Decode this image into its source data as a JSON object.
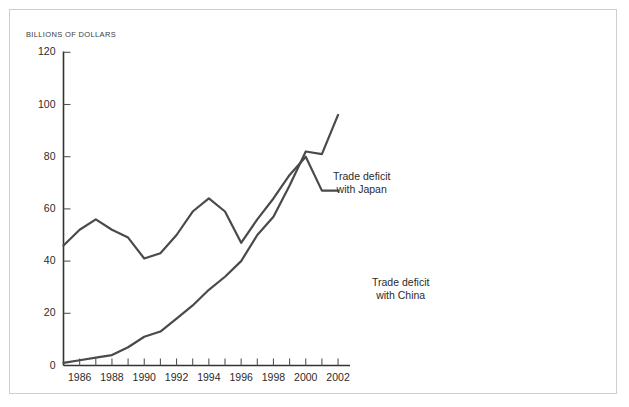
{
  "chart_data": {
    "type": "line",
    "title": "",
    "subtitle": "",
    "xlabel": "",
    "ylabel": "BILLIONS OF DOLLARS",
    "ylim": [
      0,
      128
    ],
    "xlim": [
      1985,
      2002
    ],
    "grid": false,
    "legend_position": "inline-annotations",
    "y_ticks": [
      0,
      20,
      40,
      60,
      80,
      100,
      120
    ],
    "y_tick_labels": [
      "0",
      "20",
      "40",
      "60",
      "80",
      "100",
      "120"
    ],
    "x_ticks": [
      1985,
      1986,
      1987,
      1988,
      1989,
      1990,
      1991,
      1992,
      1993,
      1994,
      1995,
      1996,
      1997,
      1998,
      1999,
      2000,
      2001,
      2002
    ],
    "x_tick_labels": [
      "",
      "1986",
      "",
      "1988",
      "",
      "1990",
      "",
      "1992",
      "",
      "1994",
      "",
      "1996",
      "",
      "1998",
      "",
      "2000",
      "",
      "2002"
    ],
    "x": [
      1985,
      1986,
      1987,
      1988,
      1989,
      1990,
      1991,
      1992,
      1993,
      1994,
      1995,
      1996,
      1997,
      1998,
      1999,
      2000,
      2001,
      2002
    ],
    "series": [
      {
        "name": "Trade deficit with Japan",
        "color": "#4a4a4a",
        "values": [
          46,
          52,
          56,
          52,
          49,
          41,
          43,
          50,
          59,
          64,
          59,
          47,
          56,
          64,
          73,
          80,
          67,
          67
        ]
      },
      {
        "name": "Trade deficit with China",
        "color": "#4a4a4a",
        "values": [
          1,
          2,
          3,
          4,
          7,
          11,
          13,
          18,
          23,
          29,
          34,
          40,
          50,
          57,
          69,
          82,
          81,
          96
        ]
      }
    ],
    "annotations": [
      {
        "name": "japan-annotation",
        "line1": "Trade deficit",
        "line2": "with Japan"
      },
      {
        "name": "china-annotation",
        "line1": "Trade deficit",
        "line2": "with China"
      }
    ]
  },
  "axis": {
    "y_title": "BILLIONS OF DOLLARS"
  }
}
